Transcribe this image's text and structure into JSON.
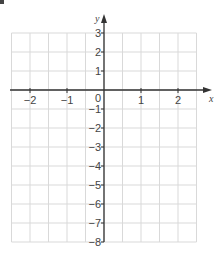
{
  "chart_data": {
    "type": "coordinate-grid",
    "title": "",
    "xlabel": "x",
    "ylabel": "y",
    "xlim": [
      -2.5,
      2.5
    ],
    "ylim": [
      -8,
      3
    ],
    "x_ticks": [
      -2,
      -1,
      0,
      1,
      2
    ],
    "y_ticks": [
      3,
      2,
      1,
      -1,
      -2,
      -3,
      -4,
      -5,
      -6,
      -7,
      -8
    ],
    "x_tick_labels": [
      "−2",
      "−1",
      "1",
      "2"
    ],
    "y_tick_labels": [
      "3",
      "2",
      "1",
      "−1",
      "−2",
      "−3",
      "−4",
      "−5",
      "−6",
      "−7",
      "−8"
    ],
    "origin_label": "0",
    "grid": true,
    "grid_minor_x_step": 0.5,
    "grid_y_step": 1,
    "series": []
  },
  "colors": {
    "grid": "#d9d9d9",
    "axis": "#333333",
    "text": "#444444"
  }
}
